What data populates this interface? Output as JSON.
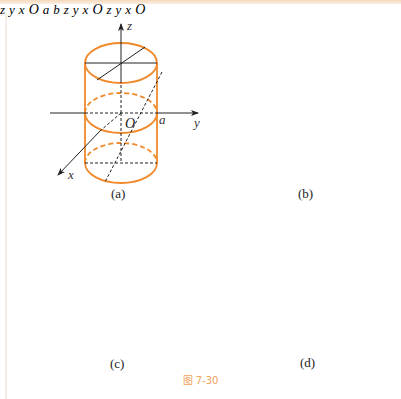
{
  "figure": {
    "caption": "图 7-30",
    "accent_color": "#f08a2c",
    "axis_color": "#222222",
    "panels": [
      {
        "id": "a",
        "label": "(a)",
        "axes": [
          "x",
          "y",
          "z"
        ],
        "origin": "O",
        "marks": [
          "a"
        ],
        "surface": "circular cylinder"
      },
      {
        "id": "b",
        "label": "(b)",
        "axes": [
          "x",
          "y",
          "z"
        ],
        "origin": "O",
        "marks": [
          "a",
          "b"
        ],
        "surface": "elliptic cylinder"
      },
      {
        "id": "c",
        "label": "(c)",
        "axes": [
          "x",
          "y",
          "z"
        ],
        "origin": "O",
        "marks": [],
        "surface": "hyperbolic cylinder"
      },
      {
        "id": "d",
        "label": "(d)",
        "axes": [
          "x",
          "y",
          "z"
        ],
        "origin": "O",
        "marks": [],
        "surface": "parabolic cylinder"
      }
    ]
  },
  "labels": {
    "a": {
      "x": "x",
      "y": "y",
      "z": "z",
      "o": "O",
      "m1": "a"
    },
    "b": {
      "x": "x",
      "y": "y",
      "z": "z",
      "o": "O",
      "m1": "a",
      "m2": "b"
    },
    "c": {
      "x": "x",
      "y": "y",
      "z": "z",
      "o": "O"
    },
    "d": {
      "x": "x",
      "y": "y",
      "z": "z",
      "o": "O"
    }
  }
}
